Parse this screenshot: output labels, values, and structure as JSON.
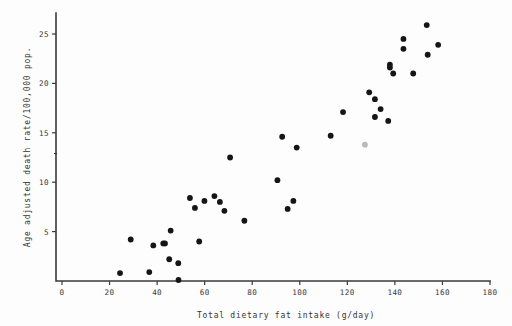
{
  "figure": {
    "background_color": "#fdfdfd",
    "point_color": "#151515",
    "axis_color": "#3a3a3a"
  },
  "chart_data": {
    "type": "scatter",
    "title": "",
    "xlabel": "Total dietary fat intake (g/day)",
    "ylabel": "Age adjusted death rate/100,000 pop.",
    "xlim": [
      0,
      180
    ],
    "ylim": [
      0,
      26.8
    ],
    "xticks": [
      0,
      20,
      40,
      60,
      80,
      100,
      120,
      140,
      160,
      180
    ],
    "xtick_labels": [
      "0",
      "20",
      "40",
      "60",
      "80",
      "100",
      "120",
      "140",
      "160",
      "180"
    ],
    "yticks": [
      5,
      10,
      15,
      20,
      25
    ],
    "ytick_labels": [
      "5",
      "10",
      "15",
      "20",
      "25"
    ],
    "grid": false,
    "legend": false,
    "marker": "filled-circle",
    "marker_size": 3.0,
    "points": [
      {
        "x": 24.4,
        "y": 0.8
      },
      {
        "x": 28.9,
        "y": 4.2
      },
      {
        "x": 36.7,
        "y": 0.9
      },
      {
        "x": 38.4,
        "y": 3.6
      },
      {
        "x": 42.6,
        "y": 3.8
      },
      {
        "x": 43.3,
        "y": 3.8
      },
      {
        "x": 45.1,
        "y": 2.2
      },
      {
        "x": 45.7,
        "y": 5.1
      },
      {
        "x": 48.9,
        "y": 1.8
      },
      {
        "x": 49.0,
        "y": 0.1
      },
      {
        "x": 53.8,
        "y": 8.4
      },
      {
        "x": 55.9,
        "y": 7.4
      },
      {
        "x": 57.7,
        "y": 4.0
      },
      {
        "x": 59.9,
        "y": 8.1
      },
      {
        "x": 64.1,
        "y": 8.6
      },
      {
        "x": 66.4,
        "y": 8.0
      },
      {
        "x": 68.3,
        "y": 7.1
      },
      {
        "x": 70.7,
        "y": 12.5
      },
      {
        "x": 76.7,
        "y": 6.1
      },
      {
        "x": 90.6,
        "y": 10.2
      },
      {
        "x": 92.6,
        "y": 14.6
      },
      {
        "x": 94.9,
        "y": 7.3
      },
      {
        "x": 97.3,
        "y": 8.1
      },
      {
        "x": 98.7,
        "y": 13.5
      },
      {
        "x": 113.0,
        "y": 14.7
      },
      {
        "x": 118.2,
        "y": 17.1
      },
      {
        "x": 127.4,
        "y": 13.8,
        "faint": true
      },
      {
        "x": 129.2,
        "y": 19.1
      },
      {
        "x": 131.6,
        "y": 18.4
      },
      {
        "x": 131.6,
        "y": 16.6
      },
      {
        "x": 134.0,
        "y": 17.4
      },
      {
        "x": 137.2,
        "y": 16.2
      },
      {
        "x": 137.9,
        "y": 21.9
      },
      {
        "x": 137.9,
        "y": 21.6
      },
      {
        "x": 139.3,
        "y": 21.0
      },
      {
        "x": 143.6,
        "y": 24.5
      },
      {
        "x": 143.6,
        "y": 23.5
      },
      {
        "x": 147.7,
        "y": 21.0
      },
      {
        "x": 153.4,
        "y": 25.9
      },
      {
        "x": 153.8,
        "y": 22.9
      },
      {
        "x": 158.2,
        "y": 23.9
      }
    ]
  }
}
